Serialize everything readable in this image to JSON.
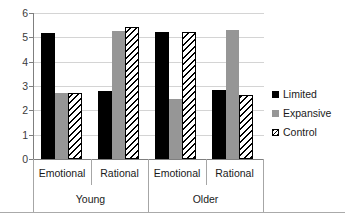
{
  "chart_data": {
    "type": "bar",
    "title": "",
    "xlabel": "",
    "ylabel": "",
    "ylim": [
      0,
      6
    ],
    "ytick_labels": [
      "6",
      "5",
      "4",
      "3",
      "2",
      "1",
      "0"
    ],
    "ytick_values": [
      6,
      5,
      4,
      3,
      2,
      1,
      0
    ],
    "grid": true,
    "legend_position": "right",
    "categories": [
      "Emotional",
      "Rational",
      "Emotional",
      "Rational"
    ],
    "group_labels": [
      "Young",
      "Older"
    ],
    "series": [
      {
        "name": "Limited",
        "color": "#000000",
        "pattern": "solid",
        "values": [
          5.18,
          2.8,
          5.2,
          2.85
        ]
      },
      {
        "name": "Expansive",
        "color": "#969696",
        "pattern": "solid",
        "values": [
          2.72,
          5.27,
          2.45,
          5.3
        ]
      },
      {
        "name": "Control",
        "color": "#ffffff",
        "pattern": "hatch",
        "values": [
          2.72,
          5.43,
          5.2,
          2.65
        ]
      }
    ]
  },
  "axis": {
    "y_labels": [
      "6",
      "5",
      "4",
      "3",
      "2",
      "1",
      "0"
    ]
  },
  "categories": {
    "c0": "Emotional",
    "c1": "Rational",
    "c2": "Emotional",
    "c3": "Rational"
  },
  "groups": {
    "g0": "Young",
    "g1": "Older"
  },
  "legend": {
    "items": [
      {
        "label": "Limited"
      },
      {
        "label": "Expansive"
      },
      {
        "label": "Control"
      }
    ],
    "l0": "Limited",
    "l1": "Expansive",
    "l2": "Control"
  }
}
